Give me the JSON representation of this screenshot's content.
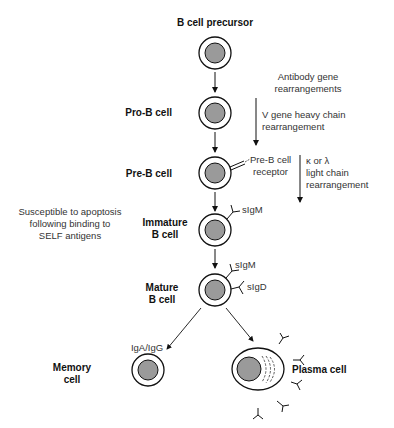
{
  "stages": {
    "precursor": "B cell precursor",
    "pro_b": "Pro-B cell",
    "pre_b": "Pre-B cell",
    "immature_1": "Immature",
    "immature_2": "B cell",
    "mature_1": "Mature",
    "mature_2": "B cell",
    "memory_1": "Memory",
    "memory_2": "cell",
    "plasma": "Plasma cell"
  },
  "annotations": {
    "antibody_1": "Antibody gene",
    "antibody_2": "rearrangements",
    "vgene_1": "V gene heavy chain",
    "vgene_2": "rearrangement",
    "preb_receptor_1": "Pre-B cell",
    "preb_receptor_2": "receptor",
    "light_1": "κ or λ",
    "light_2": "light chain",
    "light_3": "rearrangement",
    "apoptosis_1": "Susceptible to apoptosis",
    "apoptosis_2": "following binding to",
    "apoptosis_3": "SELF antigens",
    "sigm_immature": "sIgM",
    "sigm_mature": "sIgM",
    "sigd_mature": "sIgD",
    "iga_igg": "IgA/IgG"
  },
  "colors": {
    "nucleus": "#9a9a9a",
    "stroke": "#111111",
    "text": "#111111"
  }
}
